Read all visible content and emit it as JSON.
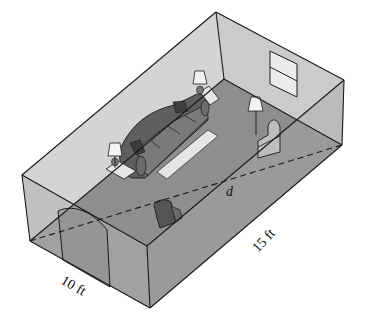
{
  "figure": {
    "labels": {
      "diagonal": "d",
      "length": "15 ft",
      "width": "10 ft"
    },
    "colors": {
      "floor": "#8f8f8f",
      "floor_front": "#9a9a9a",
      "back_wall": "#d2d2d2",
      "side_wall": "#c4c4c4",
      "edge": "#1a1a1a",
      "furniture_dark": "#5e5e5e",
      "furniture_light": "#e8e8e8"
    },
    "objects": [
      "sofa",
      "coffee-table-rug",
      "lamp-left",
      "lamp-back",
      "floor-lamp",
      "armchair",
      "chair",
      "window",
      "doorway"
    ]
  }
}
